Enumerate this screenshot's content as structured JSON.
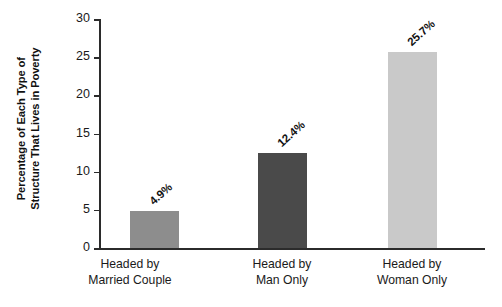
{
  "chart_data": {
    "type": "bar",
    "title": "",
    "subtitle": "",
    "xlabel": "",
    "ylabel": "Percentage of Each Type of Structure That Lives in Poverty",
    "ylabel_lines": [
      "Percentage of Each Type of",
      "Structure That Lives in Poverty"
    ],
    "categories": [
      "Headed by Married Couple",
      "Headed by Man Only",
      "Headed by Woman Only"
    ],
    "category_lines": [
      [
        "Headed by",
        "Married Couple"
      ],
      [
        "Headed by",
        "Man Only"
      ],
      [
        "Headed by",
        "Woman Only"
      ]
    ],
    "values": [
      4.9,
      12.4,
      25.7
    ],
    "data_labels": [
      "4.9%",
      "12.4%",
      "25.7%"
    ],
    "ylim": [
      0,
      30
    ],
    "yticks": [
      0,
      5,
      10,
      15,
      20,
      25,
      30
    ],
    "ytick_labels": [
      "0",
      "5",
      "10",
      "15",
      "20",
      "25",
      "30"
    ],
    "grid": false,
    "legend": "none",
    "bar_colors": [
      "#8d8d8d",
      "#4a4a4a",
      "#c9c9c9"
    ],
    "axis_color": "#2b2b2b",
    "background": "#ffffff"
  }
}
